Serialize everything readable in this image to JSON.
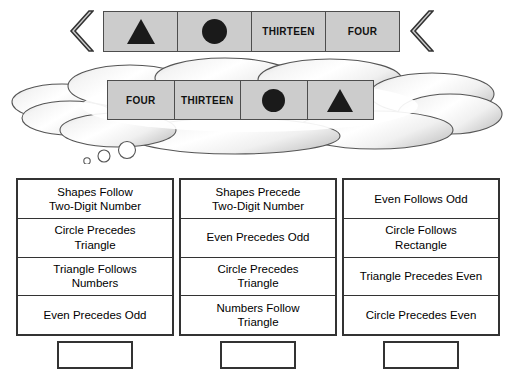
{
  "puzzle": {
    "title": "Sequence Rule Puzzle",
    "top_sequence": {
      "name": "given-sequence",
      "left_arrow_icon": "double-chevron-left-icon",
      "right_arrow_icon": "double-chevron-left-icon",
      "cells": [
        {
          "type": "shape",
          "icon": "triangle-icon",
          "label": "Triangle"
        },
        {
          "type": "shape",
          "icon": "circle-icon",
          "label": "Circle"
        },
        {
          "type": "text",
          "label": "THIRTEEN"
        },
        {
          "type": "text",
          "label": "FOUR"
        }
      ]
    },
    "thought_sequence": {
      "name": "thought-sequence",
      "cells": [
        {
          "type": "text",
          "label": "FOUR"
        },
        {
          "type": "text",
          "label": "THIRTEEN"
        },
        {
          "type": "shape",
          "icon": "circle-icon",
          "label": "Circle"
        },
        {
          "type": "shape",
          "icon": "triangle-icon",
          "label": "Triangle"
        }
      ]
    },
    "thought_bubble": {
      "name": "thought-bubble",
      "tail_bubbles": 3
    },
    "rule_columns": [
      {
        "name": "rule-column-1",
        "rules": [
          "Shapes Follow\nTwo-Digit Number",
          "Circle Precedes\nTriangle",
          "Triangle Follows\nNumbers",
          "Even Precedes Odd"
        ]
      },
      {
        "name": "rule-column-2",
        "rules": [
          "Shapes Precede\nTwo-Digit Number",
          "Even Precedes Odd",
          "Circle Precedes\nTriangle",
          "Numbers Follow\nTriangle"
        ]
      },
      {
        "name": "rule-column-3",
        "rules": [
          "Even Follows Odd",
          "Circle Follows\nRectangle",
          "Triangle Precedes Even",
          "Circle Precedes Even"
        ]
      }
    ],
    "answer_boxes": [
      {
        "name": "answer-box-1",
        "value": ""
      },
      {
        "name": "answer-box-2",
        "value": ""
      },
      {
        "name": "answer-box-3",
        "value": ""
      }
    ],
    "colors": {
      "panel_fill": "#cccccc",
      "panel_border": "#4d4d4d",
      "shape_fill": "#1a1a1a",
      "table_border": "#333333",
      "cloud_outline": "#555555",
      "chevron_fill": "#cccccc",
      "chevron_border": "#333333"
    }
  }
}
